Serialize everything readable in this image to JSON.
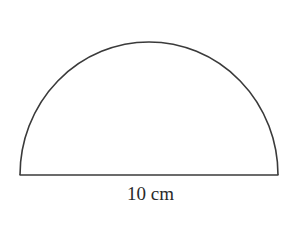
{
  "figure": {
    "shape": "semicircle",
    "diameter_label": "10 cm",
    "stroke_color": "#3a3a3a",
    "background": "#ffffff"
  }
}
